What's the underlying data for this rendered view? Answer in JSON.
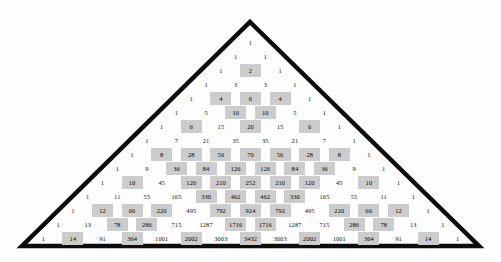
{
  "figure": {
    "shape": "triangle",
    "rows_shown": 15,
    "highlight_rule": "even",
    "colors": {
      "outline": "#0d0d0d",
      "highlight_fill": "#cccccc",
      "text": "#111111",
      "background": "#fdfdfd"
    },
    "outline_points": {
      "apex_x": 250,
      "apex_y": 22,
      "left_x": 22,
      "right_x": 479,
      "base_y": 246,
      "stroke_width": 4
    }
  },
  "chart_data": {
    "type": "table",
    "xlabel": "",
    "ylabel": "",
    "grid": false,
    "legend": [],
    "highlight_color": "#cccccc",
    "highlight_rule": "value % 2 == 0",
    "rows": [
      [
        1
      ],
      [
        1,
        1
      ],
      [
        1,
        2,
        1
      ],
      [
        1,
        3,
        3,
        1
      ],
      [
        1,
        4,
        6,
        4,
        1
      ],
      [
        1,
        5,
        10,
        10,
        5,
        1
      ],
      [
        1,
        6,
        15,
        20,
        15,
        6,
        1
      ],
      [
        1,
        7,
        21,
        35,
        35,
        21,
        7,
        1
      ],
      [
        1,
        8,
        28,
        56,
        70,
        56,
        28,
        8,
        1
      ],
      [
        1,
        9,
        36,
        84,
        126,
        126,
        84,
        36,
        9,
        1
      ],
      [
        1,
        10,
        45,
        120,
        210,
        252,
        210,
        120,
        45,
        10,
        1
      ],
      [
        1,
        11,
        55,
        165,
        330,
        462,
        462,
        330,
        165,
        55,
        11,
        1
      ],
      [
        1,
        12,
        66,
        220,
        495,
        792,
        924,
        792,
        495,
        220,
        66,
        12,
        1
      ],
      [
        1,
        13,
        78,
        286,
        715,
        1287,
        1716,
        1716,
        1287,
        715,
        286,
        78,
        13,
        1
      ],
      [
        1,
        14,
        91,
        364,
        1001,
        2002,
        3003,
        3432,
        3003,
        2002,
        1001,
        364,
        91,
        14,
        1
      ]
    ]
  }
}
